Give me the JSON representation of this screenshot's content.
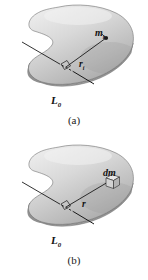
{
  "figure": {
    "panels": [
      {
        "id": "a",
        "caption": "(a)",
        "labels": {
          "point_mass": "m",
          "point_mass_sub": "i",
          "radius": "r",
          "radius_sub": "i",
          "axis": "L",
          "axis_sub": "0"
        },
        "body_shape": "kidney-blob-rigid-body",
        "marker": "point-mass-dot"
      },
      {
        "id": "b",
        "caption": "(b)",
        "labels": {
          "mass_element": "dm",
          "radius": "r",
          "radius_sub": "",
          "axis": "L",
          "axis_sub": "0"
        },
        "body_shape": "kidney-blob-rigid-body",
        "marker": "mass-element-cube"
      }
    ],
    "colors": {
      "body_light": "#e4e4e4",
      "body_mid": "#c4c4c4",
      "body_dark": "#8f8f8f",
      "body_edge": "#6f6f6f",
      "axis_line": "#1a1a1a",
      "label_text": "#111111",
      "background": "#ffffff"
    }
  }
}
